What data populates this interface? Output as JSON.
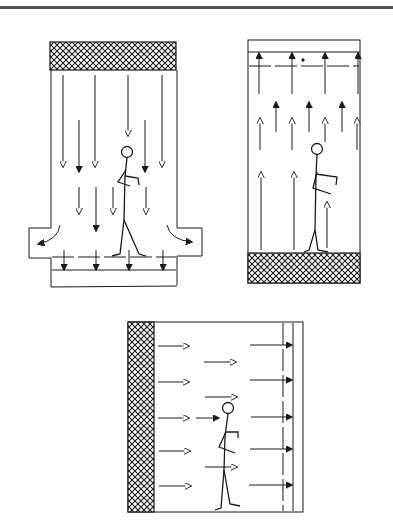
{
  "figure": {
    "width": 393,
    "height": 532,
    "line_color": "#1a1a1a",
    "rule_color": "#555555",
    "background": "#ffffff"
  },
  "panels": [
    {
      "id": "downflow",
      "description": "Vertical downflow clean room: filter ceiling, air flows down past person, exhausts through floor grating and side returns",
      "filter_position": "top",
      "flow_direction": "down",
      "arrow_styles": [
        "open-head",
        "filled-head"
      ],
      "side_returns": [
        "left",
        "right"
      ]
    },
    {
      "id": "upflow",
      "description": "Vertical upflow clean room: filter floor, air flows up past person toward ceiling exhaust",
      "filter_position": "bottom",
      "flow_direction": "up",
      "arrow_styles": [
        "open-head",
        "filled-head"
      ]
    },
    {
      "id": "crossflow",
      "description": "Horizontal crossflow clean room: filter wall on left, air flows right past person to exhaust wall",
      "filter_position": "left",
      "flow_direction": "right",
      "arrow_styles": [
        "open-head",
        "filled-head"
      ]
    }
  ]
}
